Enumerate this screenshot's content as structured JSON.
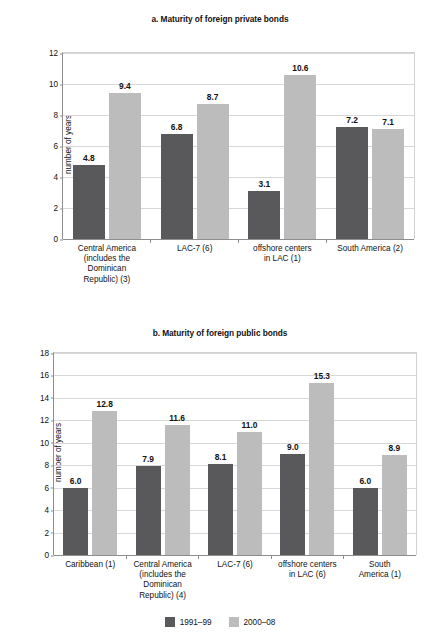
{
  "legend": {
    "items": [
      {
        "label": "1991–99",
        "color": "#59595c"
      },
      {
        "label": "2000–08",
        "color": "#bcbcbc"
      }
    ]
  },
  "chart_data": [
    {
      "id": "a",
      "type": "bar",
      "title": "a. Maturity of foreign private bonds",
      "xlabel": "",
      "ylabel": "number of years",
      "ylim": [
        0,
        12
      ],
      "yticks": [
        0,
        2,
        4,
        6,
        8,
        10,
        12
      ],
      "grid": true,
      "legend_position": "bottom-figure",
      "categories": [
        "Central America (includes the Dominican Republic) (3)",
        "LAC-7 (6)",
        "offshore centers in LAC (1)",
        "South America (2)"
      ],
      "category_lines": [
        [
          "Central America",
          "(includes the",
          "Dominican",
          "Republic) (3)"
        ],
        [
          "LAC-7 (6)"
        ],
        [
          "offshore centers",
          "in LAC (1)"
        ],
        [
          "South America (2)"
        ]
      ],
      "series": [
        {
          "name": "1991–99",
          "color": "#59595c",
          "values": [
            4.8,
            6.8,
            3.1,
            7.2
          ]
        },
        {
          "name": "2000–08",
          "color": "#bcbcbc",
          "values": [
            9.4,
            8.7,
            10.6,
            7.1
          ]
        }
      ],
      "value_labels": [
        [
          "4.8",
          "6.8",
          "3.1",
          "7.2"
        ],
        [
          "9.4",
          "8.7",
          "10.6",
          "7.1"
        ]
      ]
    },
    {
      "id": "b",
      "type": "bar",
      "title": "b. Maturity of foreign public bonds",
      "xlabel": "",
      "ylabel": "number of years",
      "ylim": [
        0,
        18
      ],
      "yticks": [
        0,
        2,
        4,
        6,
        8,
        10,
        12,
        14,
        16,
        18
      ],
      "grid": true,
      "legend_position": "bottom-figure",
      "categories": [
        "Caribbean (1)",
        "Central America (includes the Dominican Republic) (4)",
        "LAC-7 (6)",
        "offshore centers in LAC (6)",
        "South America (1)"
      ],
      "category_lines": [
        [
          "Caribbean (1)"
        ],
        [
          "Central America",
          "(includes the",
          "Dominican",
          "Republic) (4)"
        ],
        [
          "LAC-7 (6)"
        ],
        [
          "offshore centers",
          "in LAC (6)"
        ],
        [
          "South",
          "America (1)"
        ]
      ],
      "series": [
        {
          "name": "1991–99",
          "color": "#59595c",
          "values": [
            6.0,
            7.9,
            8.1,
            9.0,
            6.0
          ]
        },
        {
          "name": "2000–08",
          "color": "#bcbcbc",
          "values": [
            12.8,
            11.6,
            11.0,
            15.3,
            8.9
          ]
        }
      ],
      "value_labels": [
        [
          "6.0",
          "7.9",
          "8.1",
          "9.0",
          "6.0"
        ],
        [
          "12.8",
          "11.6",
          "11.0",
          "15.3",
          "8.9"
        ]
      ]
    }
  ]
}
